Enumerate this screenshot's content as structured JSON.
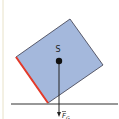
{
  "diagram": {
    "center_label": "S",
    "force_label": "F",
    "force_subscript": "G",
    "colors": {
      "background": "#ffffff",
      "margin_line": "#e8e2c8",
      "block_fill": "#a4b8dc",
      "block_stroke": "#3a3a4a",
      "highlight_edge": "#e53a2a",
      "ground": "#333333",
      "arrow": "#222222"
    }
  }
}
